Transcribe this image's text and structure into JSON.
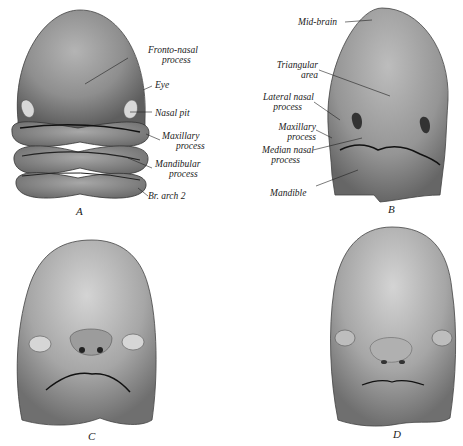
{
  "figure": {
    "panels": [
      {
        "id": "A",
        "letter": "A",
        "labels": [
          {
            "text1": "Fronto-nasal",
            "text2": "process"
          },
          {
            "text1": "Eye"
          },
          {
            "text1": "Nasal pit"
          },
          {
            "text1": "Maxillary",
            "text2": "process"
          },
          {
            "text1": "Mandibular",
            "text2": "process"
          },
          {
            "text1": "Br. arch 2"
          }
        ]
      },
      {
        "id": "B",
        "letter": "B",
        "labels": [
          {
            "text1": "Mid-brain"
          },
          {
            "text1": "Triangular",
            "text2": "area"
          },
          {
            "text1": "Lateral nasal",
            "text2": "process"
          },
          {
            "text1": "Maxillary",
            "text2": "process"
          },
          {
            "text1": "Median nasal",
            "text2": "process"
          },
          {
            "text1": "Mandible"
          }
        ]
      },
      {
        "id": "C",
        "letter": "C",
        "labels": []
      },
      {
        "id": "D",
        "letter": "D",
        "labels": []
      }
    ],
    "colors": {
      "skin_dark": "#6e6e6e",
      "skin_mid": "#9a9a9a",
      "skin_light": "#c8c8c8",
      "line": "#222222",
      "background": "#ffffff"
    }
  }
}
